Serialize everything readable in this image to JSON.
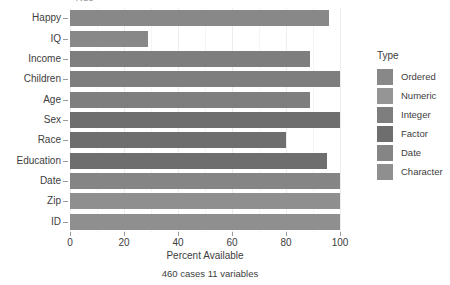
{
  "clipped_title": "Type",
  "chart_data": {
    "type": "bar",
    "orientation": "horizontal",
    "title": "",
    "xlabel": "Percent Available",
    "ylabel": "",
    "caption": "460 cases 11 variables",
    "xlim": [
      0,
      100
    ],
    "xticks": [
      0,
      20,
      40,
      60,
      80,
      100
    ],
    "xtick_labels": [
      "0",
      "20",
      "40",
      "60",
      "80",
      "100"
    ],
    "grid": true,
    "categories": [
      "Happy",
      "IQ",
      "Income",
      "Children",
      "Age",
      "Sex",
      "Race",
      "Education",
      "Date",
      "Zip",
      "ID"
    ],
    "values": [
      96,
      29,
      89,
      100,
      89,
      100,
      80,
      95,
      100,
      100,
      100
    ],
    "bar_types": [
      "Ordered",
      "Ordered",
      "Integer",
      "Integer",
      "Integer",
      "Factor",
      "Factor",
      "Factor",
      "Date",
      "Character",
      "Character"
    ],
    "bar_colors": [
      "#888888",
      "#888888",
      "#7e7e7e",
      "#7e7e7e",
      "#7e7e7e",
      "#6e6e6e",
      "#6e6e6e",
      "#6e6e6e",
      "#858585",
      "#8f8f8f",
      "#8f8f8f"
    ],
    "legend": {
      "position": "right",
      "title": "Type",
      "entries": [
        {
          "label": "Ordered",
          "color": "#888888"
        },
        {
          "label": "Numeric",
          "color": "#959595"
        },
        {
          "label": "Integer",
          "color": "#7e7e7e"
        },
        {
          "label": "Factor",
          "color": "#6e6e6e"
        },
        {
          "label": "Date",
          "color": "#858585"
        },
        {
          "label": "Character",
          "color": "#8f8f8f"
        }
      ]
    }
  }
}
